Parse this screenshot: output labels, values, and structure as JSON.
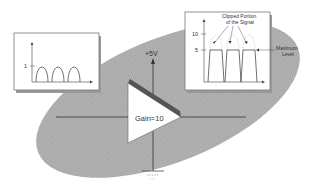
{
  "diagram": {
    "supply_label": "+5V",
    "amplifier": {
      "label": "Gain=10",
      "gain": 10
    },
    "input_graph": {
      "y_tick_label": "1",
      "y_tick_value": 1,
      "waveform": "half-wave pulses",
      "pulse_count": 3
    },
    "output_graph": {
      "y_tick_labels": [
        "10",
        "5"
      ],
      "y_tick_values": [
        10,
        5
      ],
      "annotation_clipped": [
        "Clipped Portion",
        "of the Signal"
      ],
      "annotation_max": [
        "Maximum",
        "Level"
      ],
      "waveform": "clipped pulses",
      "pulse_count": 3
    },
    "colors": {
      "ellipse": "#a8a8a8",
      "triangle_fill": "#ffffff",
      "triangle_bar": "#555555",
      "line": "#333333",
      "box_border": "#777777"
    }
  }
}
